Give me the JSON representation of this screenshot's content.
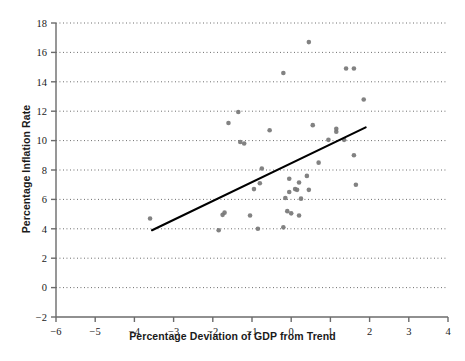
{
  "chart_data": {
    "type": "scatter",
    "title": "",
    "xlabel": "Percentage Deviation of GDP from Trend",
    "ylabel": "Percentage Inflation Rate",
    "xlim": [
      -6,
      4
    ],
    "ylim": [
      -2,
      18
    ],
    "xticks": [
      "−6",
      "−5",
      "−4",
      "−3",
      "−2",
      "−1",
      "0",
      "1",
      "2",
      "3",
      "4"
    ],
    "xtick_values": [
      -6,
      -5,
      -4,
      -3,
      -2,
      -1,
      0,
      1,
      2,
      3,
      4
    ],
    "yticks": [
      "−2",
      "0",
      "2",
      "4",
      "6",
      "8",
      "10",
      "12",
      "14",
      "16",
      "18"
    ],
    "ytick_values": [
      -2,
      0,
      2,
      4,
      6,
      8,
      10,
      12,
      14,
      16,
      18
    ],
    "grid": "horizontal-dotted",
    "legend": "none",
    "marker_color": "#777777",
    "line_color": "#000000",
    "points": [
      [
        -3.6,
        4.7
      ],
      [
        -1.85,
        3.9
      ],
      [
        -1.75,
        4.95
      ],
      [
        -1.7,
        5.1
      ],
      [
        -1.6,
        11.2
      ],
      [
        -1.35,
        11.95
      ],
      [
        -1.3,
        9.9
      ],
      [
        -1.2,
        9.8
      ],
      [
        -1.05,
        4.9
      ],
      [
        -0.85,
        4.0
      ],
      [
        -0.8,
        7.1
      ],
      [
        -0.95,
        6.7
      ],
      [
        -0.75,
        8.1
      ],
      [
        -0.55,
        10.7
      ],
      [
        -0.2,
        14.6
      ],
      [
        -0.2,
        4.1
      ],
      [
        -0.15,
        6.1
      ],
      [
        -0.1,
        5.2
      ],
      [
        -0.05,
        7.4
      ],
      [
        -0.05,
        6.5
      ],
      [
        0.0,
        5.05
      ],
      [
        0.1,
        6.7
      ],
      [
        0.15,
        6.65
      ],
      [
        0.2,
        7.15
      ],
      [
        0.2,
        4.9
      ],
      [
        0.25,
        6.05
      ],
      [
        0.4,
        7.6
      ],
      [
        0.45,
        16.7
      ],
      [
        0.45,
        6.65
      ],
      [
        0.55,
        11.05
      ],
      [
        0.7,
        8.5
      ],
      [
        0.95,
        10.05
      ],
      [
        1.15,
        10.8
      ],
      [
        1.15,
        10.6
      ],
      [
        1.35,
        10.05
      ],
      [
        1.4,
        14.9
      ],
      [
        1.6,
        14.9
      ],
      [
        1.6,
        9.0
      ],
      [
        1.65,
        7.0
      ],
      [
        1.85,
        12.8
      ]
    ],
    "trend_line": {
      "label": "fitted-regression-line",
      "x_start": -3.55,
      "y_start": 3.9,
      "x_end": 1.9,
      "y_end": 10.9
    }
  }
}
